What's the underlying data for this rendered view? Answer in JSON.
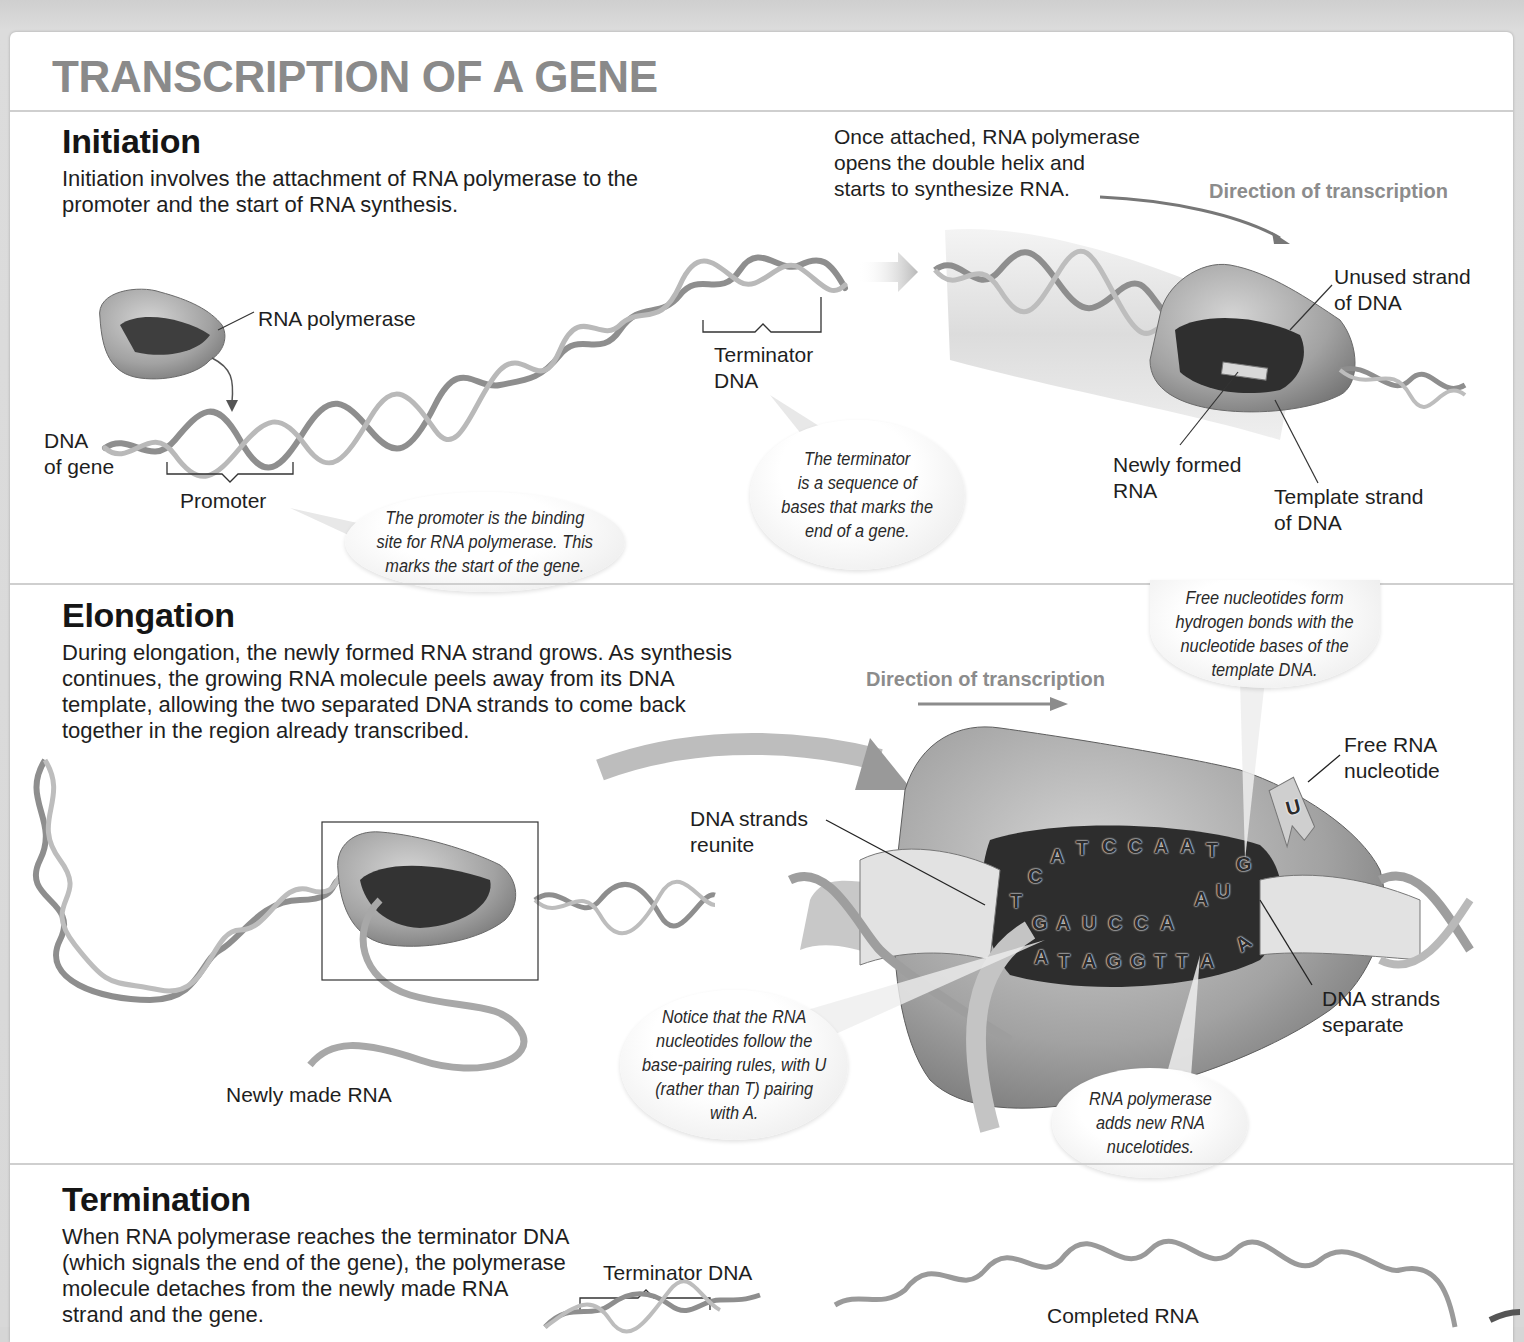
{
  "title": "TRANSCRIPTION OF A GENE",
  "colors": {
    "title": "#8a8a8a",
    "direction_label": "#8c8c8c",
    "helix": "#9a9a9a",
    "polymerase": "#8e8e8e",
    "divider": "#cfcfcf"
  },
  "initiation": {
    "heading": "Initiation",
    "description": "Initiation involves the attachment of RNA polymerase to the promoter and the start of RNA synthesis.",
    "labels": {
      "rna_polymerase": "RNA polymerase",
      "dna_of_gene": "DNA\nof gene",
      "promoter": "Promoter",
      "terminator_dna": "Terminator\nDNA",
      "once_attached": "Once attached, RNA polymerase\nopens the double helix and\nstarts to synthesize RNA.",
      "direction": "Direction of transcription",
      "unused_strand": "Unused strand\nof DNA",
      "newly_formed_rna": "Newly formed\nRNA",
      "template_strand": "Template strand\nof DNA"
    },
    "callouts": {
      "promoter": "The promoter is the binding\nsite for RNA polymerase. This\nmarks the start of the gene.",
      "terminator": "The terminator\nis a sequence of\nbases that marks the\nend of a gene."
    }
  },
  "elongation": {
    "heading": "Elongation",
    "description": "During elongation, the newly formed RNA strand grows. As synthesis continues, the growing RNA molecule peels away from its DNA template, allowing the two separated DNA strands to come back together in the region already transcribed.",
    "labels": {
      "newly_made_rna": "Newly made RNA",
      "direction": "Direction of transcription",
      "dna_strands_reunite": "DNA strands\nreunite",
      "free_rna_nucleotide": "Free RNA\nnucleotide",
      "dna_strands_separate": "DNA strands\nseparate"
    },
    "callouts": {
      "free_nucleotides": "Free nucleotides form\nhydrogen bonds with the\nnucleotide bases of the\ntemplate DNA.",
      "base_pairing": "Notice that the RNA\nnucleotides follow the\nbase-pairing rules, with U\n(rather than T) pairing\nwith A.",
      "adds_nucleotides": "RNA polymerase\nadds new RNA\nnucelotides."
    },
    "sequences": {
      "coding_strand": [
        "T",
        "C",
        "A",
        "T",
        "C",
        "C",
        "A",
        "A",
        "T",
        "G"
      ],
      "rna_strand": [
        "G",
        "A",
        "U",
        "C",
        "C",
        "A"
      ],
      "incoming_rna": [
        "A",
        "U"
      ],
      "template_strand": [
        "A",
        "T",
        "A",
        "G",
        "G",
        "T",
        "T",
        "A"
      ],
      "free_nucleotide": "U",
      "template_extra": "A"
    }
  },
  "termination": {
    "heading": "Termination",
    "description": "When RNA polymerase reaches the terminator DNA (which signals the end of the gene), the polymerase molecule detaches from the newly made RNA strand and the gene.",
    "labels": {
      "terminator_dna": "Terminator DNA",
      "completed_rna": "Completed RNA"
    }
  }
}
